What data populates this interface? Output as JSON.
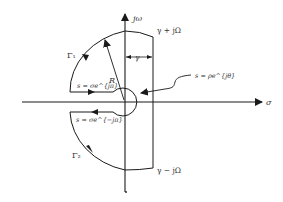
{
  "diagram": {
    "axes": {
      "vertical_label": "jω",
      "horizontal_label": "σ"
    },
    "labels": {
      "top_right": "γ + jΩ",
      "bottom_right": "γ − jΩ",
      "gamma_width": "γ",
      "radius": "R",
      "gamma1": "Γ₁",
      "gamma2": "Γ₂",
      "upper_segment": "s = σe^{jπ}",
      "lower_segment": "s = σe^{−jπ}",
      "small_circle": "s = ρe^{jθ}"
    },
    "colors": {
      "stroke": "#1a1a1a",
      "text": "#333333",
      "background": "#ffffff"
    }
  }
}
